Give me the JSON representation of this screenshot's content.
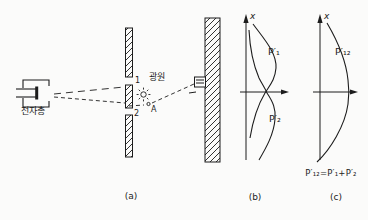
{
  "diagram": {
    "panel_a": {
      "gun_label": "전자총",
      "light_source_label": "광원",
      "slit1_label": "1",
      "slit2_label": "2",
      "point_a_label": "A",
      "caption": "(a)"
    },
    "panel_b": {
      "axis_label": "x",
      "curve1_label": "P′₁",
      "curve2_label": "P′₂",
      "caption": "(b)"
    },
    "panel_c": {
      "axis_label": "x",
      "curve_label": "P′₁₂",
      "formula": "P′₁₂=P′₁+P′₂",
      "caption": "(c)"
    },
    "colors": {
      "ink": "#1c1c1c",
      "background": "#fbfbfa"
    }
  }
}
